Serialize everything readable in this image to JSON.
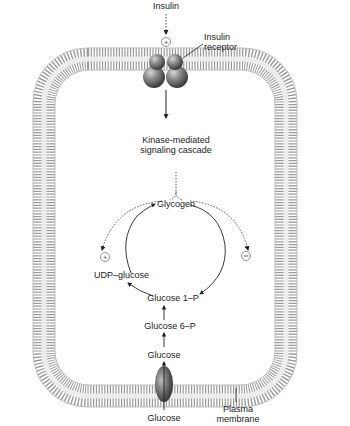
{
  "labels": {
    "insulin": "Insulin",
    "insulin_receptor_line1": "Insulin",
    "insulin_receptor_line2": "receptor",
    "cascade_line1": "Kinase-mediated",
    "cascade_line2": "signaling cascade",
    "glycogen": "Glycogen",
    "udp_glucose": "UDP–glucose",
    "glucose_1p": "Glucose 1–P",
    "glucose_6p": "Glucose 6–P",
    "glucose_inside": "Glucose",
    "glucose_outside": "Glucose",
    "plasma_membrane_line1": "Plasma",
    "plasma_membrane_line2": "membrane"
  },
  "symbols": {
    "activation": "+",
    "inhibition": "−"
  },
  "colors": {
    "membrane": "#8a8a8a",
    "membrane_light": "#d8d8d8",
    "protein": "#6e6e6e",
    "text": "#222222",
    "arrow": "#222222"
  }
}
